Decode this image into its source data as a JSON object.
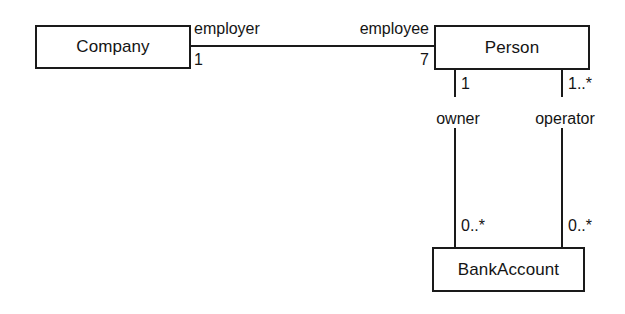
{
  "diagram": {
    "type": "uml-class-diagram",
    "background_color": "#ffffff",
    "line_color": "#1a1a1a",
    "text_color": "#141414",
    "classes": [
      {
        "id": "company",
        "name": "Company"
      },
      {
        "id": "person",
        "name": "Person"
      },
      {
        "id": "bankaccount",
        "name": "BankAccount"
      }
    ],
    "associations": [
      {
        "id": "employment",
        "orientation": "horizontal",
        "from": {
          "class": "Company",
          "role": "employer",
          "multiplicity": "1"
        },
        "to": {
          "class": "Person",
          "role": "employee",
          "multiplicity": "7"
        }
      },
      {
        "id": "ownership",
        "orientation": "vertical",
        "from": {
          "class": "Person",
          "role": "owner",
          "multiplicity": "1"
        },
        "to": {
          "class": "BankAccount",
          "role": "",
          "multiplicity": "0..*"
        }
      },
      {
        "id": "operation",
        "orientation": "vertical",
        "from": {
          "class": "Person",
          "role": "operator",
          "multiplicity": "1..*"
        },
        "to": {
          "class": "BankAccount",
          "role": "",
          "multiplicity": "0..*"
        }
      }
    ]
  }
}
